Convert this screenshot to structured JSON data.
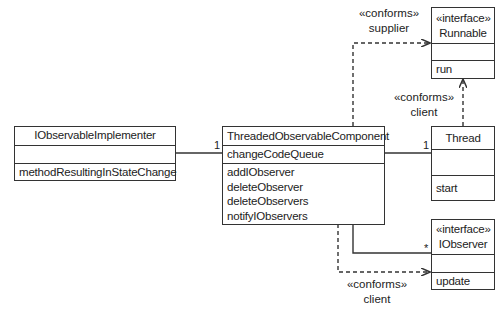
{
  "diagram": {
    "type": "UML class diagram",
    "classes": {
      "implementer": {
        "name": "IObservableImplementer",
        "attributes": [],
        "operations": [
          "methodResultingInStateChange"
        ]
      },
      "component": {
        "name": "ThreadedObservableComponent",
        "attributes": [
          "changeCodeQueue"
        ],
        "operations": [
          "addIObserver",
          "deleteObserver",
          "deleteObservers",
          "notifyIObservers"
        ]
      },
      "runnable": {
        "stereotype": "«interface»",
        "name": "Runnable",
        "attributes": [],
        "operations": [
          "run"
        ]
      },
      "thread": {
        "name": "Thread",
        "attributes": [],
        "operations": [
          "start"
        ]
      },
      "iobserver": {
        "stereotype": "«interface»",
        "name": "IObserver",
        "attributes": [],
        "operations": [
          "update"
        ]
      }
    },
    "relations": {
      "supplier": {
        "stereotype": "«conforms»",
        "role": "supplier",
        "from": "ThreadedObservableComponent",
        "to": "Runnable",
        "kind": "dependency"
      },
      "thread_client": {
        "stereotype": "«conforms»",
        "role": "client",
        "from": "Thread",
        "to": "Runnable",
        "kind": "dependency"
      },
      "observer_client": {
        "stereotype": "«conforms»",
        "role": "client",
        "from": "ThreadedObservableComponent",
        "to": "IObserver",
        "kind": "dependency"
      },
      "impl_assoc": {
        "multiplicity": "1",
        "from": "IObservableImplementer",
        "to": "ThreadedObservableComponent"
      },
      "thread_assoc": {
        "multiplicity": "1",
        "from": "ThreadedObservableComponent",
        "to": "Thread"
      },
      "observer_assoc": {
        "multiplicity": "*",
        "from": "ThreadedObservableComponent",
        "to": "IObserver"
      }
    }
  }
}
